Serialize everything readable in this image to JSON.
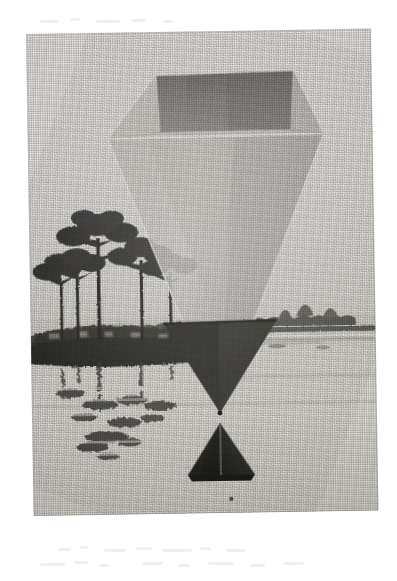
{
  "page": {
    "background_color": "#ffffff",
    "kind": "halftone-printed photograph"
  },
  "plate": {
    "left": 26,
    "top": 34,
    "width": 345,
    "height": 482,
    "rotation_deg": -0.9,
    "paper_color": "#e4e2de",
    "border_color": "#7a7872"
  },
  "scene": {
    "caption": "",
    "sky_color": "#e4e2dd",
    "water_color": "#dcdad4",
    "horizon_y": 292,
    "waterline_y": 318,
    "foliage_color": "#2b2a27",
    "distant_tree_color": "#4e4c47"
  },
  "trees": {
    "description": "pine trees silhouetted on a spit of land at left",
    "count": 5,
    "trunk_color": "#23221f",
    "canopy_color": "#2d2c28"
  },
  "reflections": {
    "description": "broken vertical tree reflections in still water",
    "color": "#35332f"
  },
  "figure": {
    "name": "translucent funnel diagram",
    "top_rim_left_x": 128,
    "top_rim_right_x": 268,
    "widest_left_x": 80,
    "widest_right_x": 296,
    "widest_y": 106,
    "apex_x": 188,
    "apex_y": 382,
    "inner_face_color": "#8d8b86",
    "body_fill_color": "#cbc9c3",
    "edge_highlight_color": "#f2f0ec",
    "dark_cone_color": "#2f2e2b"
  },
  "pyramid": {
    "name": "solid dark pyramid",
    "apex_x": 188,
    "apex_y": 392,
    "base_left_x": 155,
    "base_right_x": 222,
    "base_y": 444,
    "left_face_color": "#2b2a27",
    "right_face_color": "#15141300",
    "ridge_color": "#6a6863"
  }
}
